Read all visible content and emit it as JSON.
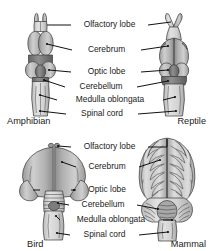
{
  "figure": {
    "background_color": "#ffffff",
    "line_color": "#111111",
    "text_color": "#1a1a1a"
  },
  "panels": [
    {
      "id": "top",
      "left_specimen": "Amphibian",
      "right_specimen": "Reptile"
    },
    {
      "id": "bottom",
      "left_specimen": "Bird",
      "right_specimen": "Mammal"
    }
  ],
  "labels": {
    "olfactory_lobe": "Olfactory lobe",
    "cerebrum": "Cerebrum",
    "optic_lobe": "Optic lobe",
    "cerebellum": "Cerebellum",
    "medulla_oblongata": "Medulla oblongata",
    "spinal_cord": "Spinal cord"
  },
  "captions": {
    "amphibian": "Amphibian",
    "reptile": "Reptile",
    "bird": "Bird",
    "mammal": "Mammal"
  },
  "colors": {
    "brain_light": "#d2d2d2",
    "brain_mid": "#b4b4b4",
    "brain_dark": "#8a8a8a",
    "brain_darkest": "#6e6e6e",
    "cord_light": "#dcdcdc",
    "outline": "#3a3a3a"
  }
}
